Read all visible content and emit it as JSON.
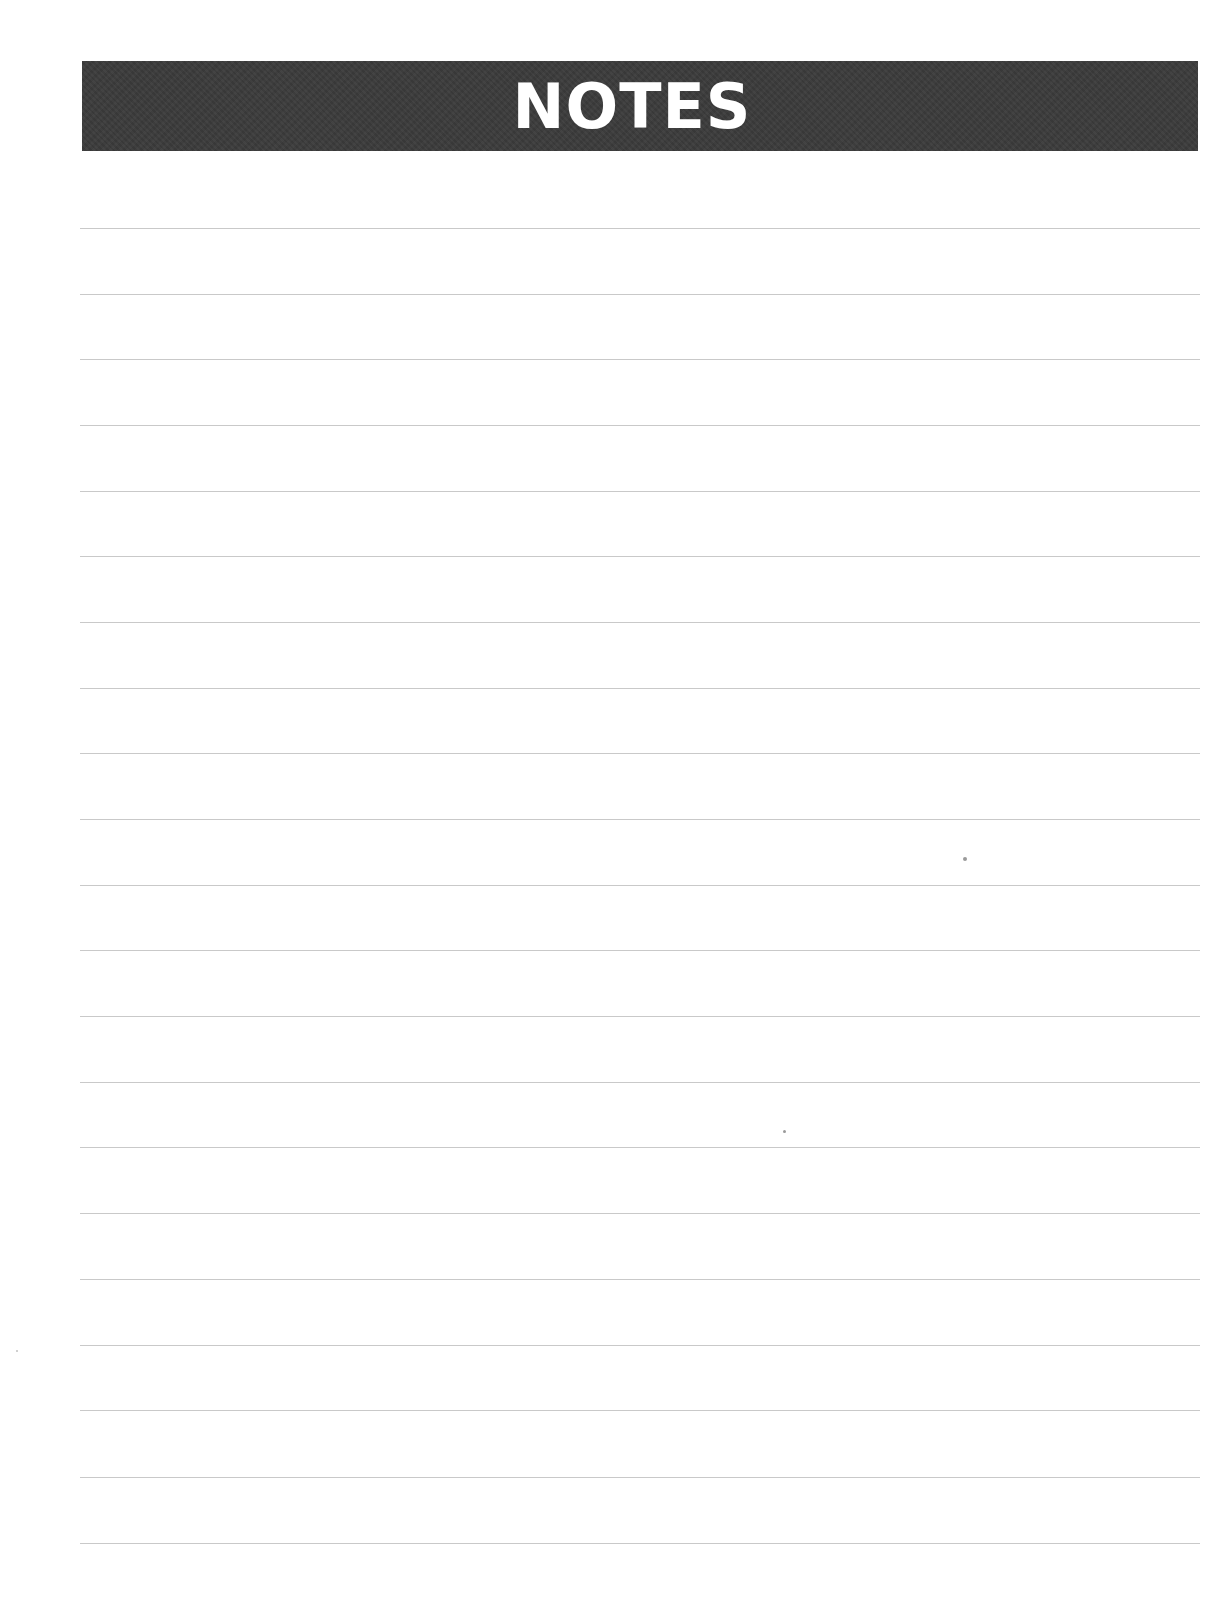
{
  "page": {
    "title": "NOTES",
    "header_background": "#3b3b3b",
    "header_text_color": "#ffffff",
    "rule_color": "#c9c9c9",
    "rule_count": 21
  },
  "rules": [
    {
      "index": 1,
      "text": ""
    },
    {
      "index": 2,
      "text": ""
    },
    {
      "index": 3,
      "text": ""
    },
    {
      "index": 4,
      "text": ""
    },
    {
      "index": 5,
      "text": ""
    },
    {
      "index": 6,
      "text": ""
    },
    {
      "index": 7,
      "text": ""
    },
    {
      "index": 8,
      "text": ""
    },
    {
      "index": 9,
      "text": ""
    },
    {
      "index": 10,
      "text": ""
    },
    {
      "index": 11,
      "text": ""
    },
    {
      "index": 12,
      "text": ""
    },
    {
      "index": 13,
      "text": ""
    },
    {
      "index": 14,
      "text": ""
    },
    {
      "index": 15,
      "text": ""
    },
    {
      "index": 16,
      "text": ""
    },
    {
      "index": 17,
      "text": ""
    },
    {
      "index": 18,
      "text": ""
    },
    {
      "index": 19,
      "text": ""
    },
    {
      "index": 20,
      "text": ""
    },
    {
      "index": 21,
      "text": ""
    }
  ]
}
